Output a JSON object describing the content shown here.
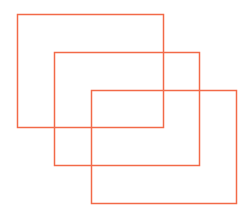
{
  "canvas": {
    "width": 250,
    "height": 218,
    "background": "#ffffff"
  },
  "style": {
    "stroke": "#f26a48",
    "stroke_width": 1.5
  },
  "rectangles": [
    {
      "id": "rect-1",
      "x": 17,
      "y": 14,
      "width": 146,
      "height": 113
    },
    {
      "id": "rect-2",
      "x": 54,
      "y": 52,
      "width": 145,
      "height": 113
    },
    {
      "id": "rect-3",
      "x": 91,
      "y": 90,
      "width": 145,
      "height": 113
    }
  ]
}
